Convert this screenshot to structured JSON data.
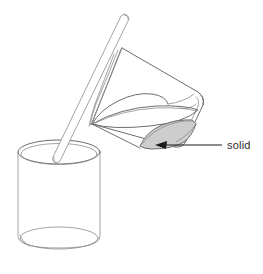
{
  "figure": {
    "type": "line-diagram",
    "background_color": "#ffffff",
    "line_color": "#6e6e72",
    "annotation_color": "#1b1b1b"
  },
  "annotations": [
    {
      "id": "solid-callout",
      "label": "solid",
      "text_x": 227,
      "text_y": 149,
      "leader_from_x": 222,
      "leader_from_y": 145,
      "leader_to_x": 160,
      "leader_to_y": 145,
      "arrow_tip_x": 155,
      "arrow_tip_y": 145,
      "color": "#1b1b1b"
    }
  ],
  "objects": {
    "tilted_beaker": {
      "name": "tilted-beaker",
      "description": "upper beaker tipped forward and to the left, pouring",
      "fill": "#ffffff",
      "stroke": "#6e6e72"
    },
    "liquid_surface": {
      "name": "liquid-surface",
      "description": "elliptical liquid surface inside the tilted beaker",
      "fill": "#fbfbfb",
      "stroke": "#6e6e72"
    },
    "solid_deposit": {
      "name": "solid-deposit",
      "description": "grey shaded solid settled in the lower corner of the tilted beaker",
      "fill": "#cfcfcf",
      "stroke": "#6e6e72"
    },
    "stirring_rod": {
      "name": "stirring-rod",
      "description": "glass stirring rod guiding the pour into the lower beaker",
      "fill": "#ffffff",
      "stroke": "#7a7a7e"
    },
    "receiving_beaker": {
      "name": "receiving-beaker",
      "description": "upright cylindrical beaker below receiving the pour",
      "fill": "#ffffff",
      "stroke": "#8b8b90",
      "top_rim_cx": 59,
      "top_rim_cy": 152,
      "top_rim_rx": 41,
      "top_rim_ry": 12,
      "base_cy": 246,
      "left_x": 18,
      "right_x": 100
    }
  }
}
